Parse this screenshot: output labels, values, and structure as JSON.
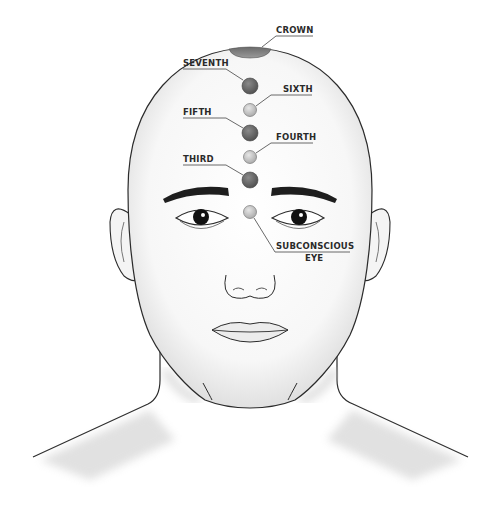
{
  "colors": {
    "dark_dot": "#6b6b6b",
    "light_dot": "#c9c9c9",
    "crown": "#8a8a8a",
    "outline": "#2b2b2b",
    "background": "#ffffff"
  },
  "points": [
    {
      "id": "crown",
      "label": "CROWN",
      "shade": "dark"
    },
    {
      "id": "seventh",
      "label": "SEVENTH",
      "shade": "dark"
    },
    {
      "id": "sixth",
      "label": "SIXTH",
      "shade": "light"
    },
    {
      "id": "fifth",
      "label": "FIFTH",
      "shade": "dark"
    },
    {
      "id": "fourth",
      "label": "FOURTH",
      "shade": "light"
    },
    {
      "id": "third",
      "label": "THIRD",
      "shade": "dark"
    },
    {
      "id": "subconscious-eye",
      "label": "SUBCONSCIOUS",
      "label_line2": "EYE",
      "shade": "light"
    }
  ]
}
